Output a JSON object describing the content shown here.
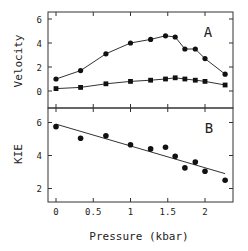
{
  "chart_data": [
    {
      "type": "line",
      "panel_label": "A",
      "title": "",
      "xlabel": "Pressure (kbar)",
      "ylabel": "Velocity",
      "xlim": [
        -0.1,
        2.4
      ],
      "ylim": [
        -1.4,
        6.6
      ],
      "yticks": [
        0,
        2,
        4,
        6
      ],
      "ytick_labels": [
        "0",
        "2",
        "4",
        "6"
      ],
      "xticks": [
        0,
        0.5,
        1,
        1.5,
        2
      ],
      "grid": false,
      "x": [
        0,
        0.33,
        0.67,
        1.0,
        1.27,
        1.47,
        1.6,
        1.73,
        1.87,
        2.0,
        2.27
      ],
      "series": [
        {
          "name": "upper (circles)",
          "marker": "circle",
          "values": [
            1.0,
            1.7,
            3.1,
            4.0,
            4.3,
            4.6,
            4.5,
            3.5,
            3.5,
            2.7,
            1.4
          ]
        },
        {
          "name": "lower (squares)",
          "marker": "square",
          "values": [
            0.2,
            0.3,
            0.6,
            0.8,
            0.9,
            1.0,
            1.1,
            1.0,
            0.9,
            0.8,
            0.5
          ]
        }
      ]
    },
    {
      "type": "scatter",
      "panel_label": "B",
      "title": "",
      "xlabel": "Pressure (kbar)",
      "ylabel": "KIE",
      "xlim": [
        -0.1,
        2.4
      ],
      "ylim": [
        1.3,
        6.8
      ],
      "yticks": [
        2,
        4,
        6
      ],
      "ytick_labels": [
        "2",
        "4",
        "6"
      ],
      "xticks": [
        0,
        0.5,
        1,
        1.5,
        2
      ],
      "xtick_labels": [
        "0",
        "0.5",
        "1",
        "1.5",
        "2"
      ],
      "grid": false,
      "x": [
        0,
        0.33,
        0.67,
        1.0,
        1.27,
        1.47,
        1.6,
        1.73,
        1.87,
        2.0,
        2.27
      ],
      "series": [
        {
          "name": "KIE",
          "marker": "circle",
          "values": [
            5.75,
            5.05,
            5.2,
            4.65,
            4.4,
            4.5,
            3.95,
            3.25,
            3.6,
            3.05,
            2.5
          ]
        }
      ],
      "fit_line": {
        "x": [
          0,
          2.27
        ],
        "y": [
          5.9,
          2.9
        ]
      }
    }
  ],
  "labels": {
    "panel_a": "A",
    "panel_b": "B",
    "ylabel_a": "Velocity",
    "ylabel_b": "KIE",
    "xlabel": "Pressure (kbar)"
  }
}
